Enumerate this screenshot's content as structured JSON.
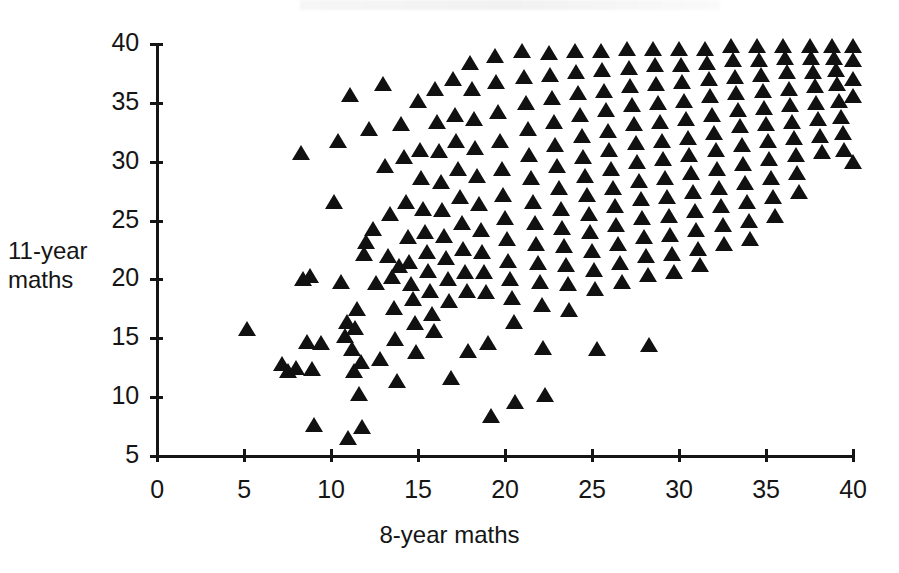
{
  "figure": {
    "type": "scatter-plot",
    "marker_shape": "filled-triangle",
    "marker_color": "#111111",
    "background_color": "#ffffff",
    "axis_color": "#151515"
  },
  "axes": {
    "x": {
      "label": "8-year maths",
      "ticks": [
        0,
        5,
        10,
        15,
        20,
        25,
        30,
        35,
        40
      ],
      "tick_labels": [
        "0",
        "5",
        "10",
        "15",
        "20",
        "25",
        "30",
        "35",
        "40"
      ],
      "min": 0,
      "max": 40
    },
    "y": {
      "label_line1": "11-year",
      "label_line2": "maths",
      "ticks": [
        5,
        10,
        15,
        20,
        25,
        30,
        35,
        40
      ],
      "tick_labels": [
        "5",
        "10",
        "15",
        "20",
        "25",
        "30",
        "35",
        "40"
      ],
      "min": 5,
      "max": 40
    }
  },
  "chart_data": {
    "type": "scatter",
    "title": "",
    "xlabel": "8-year maths",
    "ylabel": "11-year maths",
    "xlim": [
      0,
      40
    ],
    "ylim": [
      5,
      40
    ],
    "xticks": [
      0,
      5,
      10,
      15,
      20,
      25,
      30,
      35,
      40
    ],
    "yticks": [
      5,
      10,
      15,
      20,
      25,
      30,
      35,
      40
    ],
    "grid": false,
    "legend": null,
    "marker": "triangle",
    "marker_color": "#111111",
    "n_points": 430,
    "points": [
      [
        5.2,
        15.8
      ],
      [
        7.2,
        12.8
      ],
      [
        7.5,
        12.2
      ],
      [
        8.0,
        12.5
      ],
      [
        8.3,
        30.7
      ],
      [
        8.4,
        20.0
      ],
      [
        8.6,
        14.7
      ],
      [
        8.8,
        20.3
      ],
      [
        8.9,
        12.4
      ],
      [
        9.0,
        7.6
      ],
      [
        9.4,
        14.6
      ],
      [
        10.2,
        26.6
      ],
      [
        10.4,
        31.8
      ],
      [
        10.6,
        19.8
      ],
      [
        10.8,
        15.2
      ],
      [
        10.9,
        16.4
      ],
      [
        11.0,
        6.5
      ],
      [
        11.1,
        35.7
      ],
      [
        11.2,
        14.1
      ],
      [
        11.3,
        12.2
      ],
      [
        11.4,
        15.9
      ],
      [
        11.5,
        17.5
      ],
      [
        11.6,
        10.3
      ],
      [
        11.7,
        13.0
      ],
      [
        11.8,
        7.5
      ],
      [
        11.9,
        22.2
      ],
      [
        12.0,
        23.2
      ],
      [
        12.2,
        32.8
      ],
      [
        12.4,
        24.3
      ],
      [
        12.6,
        19.7
      ],
      [
        12.8,
        13.2
      ],
      [
        13.0,
        36.6
      ],
      [
        13.1,
        29.6
      ],
      [
        13.3,
        22.0
      ],
      [
        13.4,
        25.6
      ],
      [
        13.5,
        20.2
      ],
      [
        13.6,
        17.6
      ],
      [
        13.7,
        14.9
      ],
      [
        13.8,
        11.4
      ],
      [
        13.9,
        21.1
      ],
      [
        14.0,
        33.2
      ],
      [
        14.2,
        30.4
      ],
      [
        14.3,
        26.6
      ],
      [
        14.4,
        23.6
      ],
      [
        14.5,
        21.5
      ],
      [
        14.6,
        19.6
      ],
      [
        14.7,
        18.3
      ],
      [
        14.8,
        16.3
      ],
      [
        14.9,
        13.8
      ],
      [
        15.0,
        35.2
      ],
      [
        15.1,
        31.0
      ],
      [
        15.2,
        28.6
      ],
      [
        15.3,
        26.0
      ],
      [
        15.4,
        24.0
      ],
      [
        15.5,
        22.3
      ],
      [
        15.6,
        20.7
      ],
      [
        15.7,
        19.0
      ],
      [
        15.8,
        17.1
      ],
      [
        15.9,
        15.6
      ],
      [
        16.0,
        36.2
      ],
      [
        16.1,
        33.4
      ],
      [
        16.2,
        30.9
      ],
      [
        16.3,
        28.3
      ],
      [
        16.4,
        25.9
      ],
      [
        16.5,
        23.7
      ],
      [
        16.6,
        21.8
      ],
      [
        16.7,
        20.0
      ],
      [
        16.8,
        18.2
      ],
      [
        16.9,
        11.6
      ],
      [
        17.0,
        37.0
      ],
      [
        17.1,
        34.0
      ],
      [
        17.2,
        31.8
      ],
      [
        17.3,
        29.4
      ],
      [
        17.4,
        27.0
      ],
      [
        17.5,
        24.8
      ],
      [
        17.6,
        22.6
      ],
      [
        17.7,
        20.6
      ],
      [
        17.8,
        19.0
      ],
      [
        17.9,
        13.9
      ],
      [
        18.0,
        38.4
      ],
      [
        18.1,
        36.2
      ],
      [
        18.2,
        33.6
      ],
      [
        18.3,
        31.2
      ],
      [
        18.4,
        28.8
      ],
      [
        18.5,
        26.4
      ],
      [
        18.6,
        24.2
      ],
      [
        18.7,
        22.3
      ],
      [
        18.8,
        20.6
      ],
      [
        18.9,
        18.9
      ],
      [
        19.0,
        14.6
      ],
      [
        19.2,
        8.4
      ],
      [
        19.4,
        39.0
      ],
      [
        19.5,
        36.8
      ],
      [
        19.6,
        34.2
      ],
      [
        19.7,
        31.8
      ],
      [
        19.8,
        29.4
      ],
      [
        19.9,
        27.2
      ],
      [
        20.0,
        25.2
      ],
      [
        20.1,
        23.4
      ],
      [
        20.2,
        21.6
      ],
      [
        20.3,
        20.0
      ],
      [
        20.4,
        18.4
      ],
      [
        20.5,
        16.4
      ],
      [
        20.6,
        9.6
      ],
      [
        21.0,
        39.4
      ],
      [
        21.1,
        37.2
      ],
      [
        21.2,
        35.0
      ],
      [
        21.3,
        32.8
      ],
      [
        21.4,
        30.6
      ],
      [
        21.5,
        28.6
      ],
      [
        21.6,
        26.6
      ],
      [
        21.7,
        24.8
      ],
      [
        21.8,
        23.0
      ],
      [
        21.9,
        21.4
      ],
      [
        22.0,
        19.8
      ],
      [
        22.1,
        17.8
      ],
      [
        22.2,
        14.2
      ],
      [
        22.3,
        10.2
      ],
      [
        22.5,
        39.2
      ],
      [
        22.6,
        37.4
      ],
      [
        22.7,
        35.4
      ],
      [
        22.8,
        33.4
      ],
      [
        22.9,
        31.4
      ],
      [
        23.0,
        29.6
      ],
      [
        23.1,
        27.8
      ],
      [
        23.2,
        26.0
      ],
      [
        23.3,
        24.4
      ],
      [
        23.4,
        22.8
      ],
      [
        23.5,
        21.2
      ],
      [
        23.6,
        19.6
      ],
      [
        23.7,
        17.4
      ],
      [
        24.0,
        39.4
      ],
      [
        24.1,
        37.6
      ],
      [
        24.2,
        35.8
      ],
      [
        24.3,
        34.0
      ],
      [
        24.4,
        32.2
      ],
      [
        24.5,
        30.4
      ],
      [
        24.6,
        28.8
      ],
      [
        24.7,
        27.2
      ],
      [
        24.8,
        25.6
      ],
      [
        24.9,
        24.0
      ],
      [
        25.0,
        22.4
      ],
      [
        25.1,
        20.8
      ],
      [
        25.2,
        19.2
      ],
      [
        25.3,
        14.1
      ],
      [
        25.5,
        39.4
      ],
      [
        25.6,
        37.8
      ],
      [
        25.7,
        36.0
      ],
      [
        25.8,
        34.4
      ],
      [
        25.9,
        32.6
      ],
      [
        26.0,
        31.0
      ],
      [
        26.1,
        29.4
      ],
      [
        26.2,
        27.8
      ],
      [
        26.3,
        26.2
      ],
      [
        26.4,
        24.6
      ],
      [
        26.5,
        23.0
      ],
      [
        26.6,
        21.4
      ],
      [
        26.7,
        19.8
      ],
      [
        27.0,
        39.6
      ],
      [
        27.1,
        38.0
      ],
      [
        27.2,
        36.4
      ],
      [
        27.3,
        34.8
      ],
      [
        27.4,
        33.2
      ],
      [
        27.5,
        31.6
      ],
      [
        27.6,
        30.0
      ],
      [
        27.7,
        28.4
      ],
      [
        27.8,
        26.8
      ],
      [
        27.9,
        25.2
      ],
      [
        28.0,
        23.6
      ],
      [
        28.1,
        22.0
      ],
      [
        28.2,
        20.4
      ],
      [
        28.3,
        14.4
      ],
      [
        28.5,
        39.6
      ],
      [
        28.6,
        38.2
      ],
      [
        28.7,
        36.6
      ],
      [
        28.8,
        35.0
      ],
      [
        28.9,
        33.4
      ],
      [
        29.0,
        31.8
      ],
      [
        29.1,
        30.2
      ],
      [
        29.2,
        28.6
      ],
      [
        29.3,
        27.0
      ],
      [
        29.4,
        25.4
      ],
      [
        29.5,
        23.8
      ],
      [
        29.6,
        22.2
      ],
      [
        29.7,
        20.6
      ],
      [
        30.0,
        39.6
      ],
      [
        30.1,
        38.2
      ],
      [
        30.2,
        36.8
      ],
      [
        30.3,
        35.2
      ],
      [
        30.4,
        33.6
      ],
      [
        30.5,
        32.0
      ],
      [
        30.6,
        30.6
      ],
      [
        30.7,
        29.0
      ],
      [
        30.8,
        27.4
      ],
      [
        30.9,
        25.8
      ],
      [
        31.0,
        24.2
      ],
      [
        31.1,
        22.6
      ],
      [
        31.2,
        21.2
      ],
      [
        31.5,
        39.6
      ],
      [
        31.6,
        38.4
      ],
      [
        31.7,
        37.0
      ],
      [
        31.8,
        35.6
      ],
      [
        31.9,
        34.0
      ],
      [
        32.0,
        32.4
      ],
      [
        32.1,
        31.0
      ],
      [
        32.2,
        29.4
      ],
      [
        32.3,
        27.8
      ],
      [
        32.4,
        26.2
      ],
      [
        32.5,
        24.6
      ],
      [
        32.6,
        23.0
      ],
      [
        33.0,
        39.8
      ],
      [
        33.1,
        38.6
      ],
      [
        33.2,
        37.2
      ],
      [
        33.3,
        35.8
      ],
      [
        33.4,
        34.4
      ],
      [
        33.5,
        33.0
      ],
      [
        33.6,
        31.4
      ],
      [
        33.7,
        29.8
      ],
      [
        33.8,
        28.2
      ],
      [
        33.9,
        26.6
      ],
      [
        34.0,
        25.0
      ],
      [
        34.1,
        23.4
      ],
      [
        34.5,
        39.8
      ],
      [
        34.6,
        38.6
      ],
      [
        34.7,
        37.4
      ],
      [
        34.8,
        36.0
      ],
      [
        34.9,
        34.6
      ],
      [
        35.0,
        33.2
      ],
      [
        35.1,
        31.8
      ],
      [
        35.2,
        30.2
      ],
      [
        35.3,
        28.6
      ],
      [
        35.4,
        27.0
      ],
      [
        35.5,
        25.4
      ],
      [
        36.0,
        39.8
      ],
      [
        36.1,
        38.8
      ],
      [
        36.2,
        37.6
      ],
      [
        36.3,
        36.2
      ],
      [
        36.4,
        34.8
      ],
      [
        36.5,
        33.4
      ],
      [
        36.6,
        32.0
      ],
      [
        36.7,
        30.6
      ],
      [
        36.8,
        29.0
      ],
      [
        36.9,
        27.4
      ],
      [
        37.5,
        39.8
      ],
      [
        37.6,
        38.8
      ],
      [
        37.7,
        37.6
      ],
      [
        37.8,
        36.4
      ],
      [
        37.9,
        35.0
      ],
      [
        38.0,
        33.6
      ],
      [
        38.1,
        32.2
      ],
      [
        38.2,
        30.8
      ],
      [
        38.8,
        39.8
      ],
      [
        38.9,
        38.8
      ],
      [
        39.0,
        37.8
      ],
      [
        39.1,
        36.6
      ],
      [
        39.2,
        35.2
      ],
      [
        39.3,
        33.8
      ],
      [
        39.4,
        32.4
      ],
      [
        39.5,
        31.0
      ],
      [
        40.0,
        39.8
      ],
      [
        40.0,
        38.6
      ],
      [
        40.0,
        37.0
      ],
      [
        40.0,
        35.6
      ],
      [
        40.0,
        30.0
      ]
    ]
  }
}
